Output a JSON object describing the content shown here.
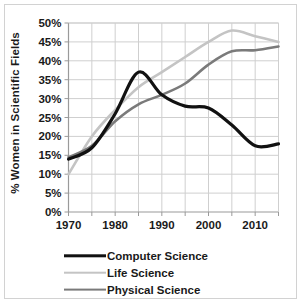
{
  "chart_data": {
    "type": "line",
    "title": "",
    "xlabel": "",
    "ylabel": "% Women in Scientific Fields",
    "xlim": [
      1970,
      2015
    ],
    "ylim": [
      0,
      50
    ],
    "grid": true,
    "legend_position": "bottom",
    "y_ticks": [
      "50%",
      "45%",
      "40%",
      "35%",
      "30%",
      "25%",
      "20%",
      "15%",
      "10%",
      "5%",
      "0%"
    ],
    "y_tick_values": [
      50,
      45,
      40,
      35,
      30,
      25,
      20,
      15,
      10,
      5,
      0
    ],
    "x_ticks": [
      "1970",
      "1980",
      "1990",
      "2000",
      "2010"
    ],
    "x_tick_values": [
      1970,
      1980,
      1990,
      2000,
      2010
    ],
    "x_minor_gridlines": [
      1975,
      1985,
      1995,
      2005,
      2015
    ],
    "x": [
      1970,
      1975,
      1980,
      1985,
      1990,
      1995,
      2000,
      2005,
      2010,
      2015
    ],
    "series": [
      {
        "name": "Computer Science",
        "color": "#111111",
        "width": 3.2,
        "values": [
          14,
          17,
          26,
          37,
          31,
          28,
          27.5,
          23,
          17.5,
          18
        ]
      },
      {
        "name": "Life Science",
        "color": "#c4c4c4",
        "width": 2.6,
        "values": [
          10,
          20,
          27,
          33,
          37,
          41,
          45,
          48,
          46.5,
          45
        ]
      },
      {
        "name": "Physical Science",
        "color": "#7a7a7a",
        "width": 2.6,
        "values": [
          14.5,
          17.5,
          24,
          28.5,
          31,
          34,
          39,
          42.5,
          42.8,
          43.8
        ]
      }
    ]
  },
  "legend": {
    "items": [
      {
        "label": "Computer Science",
        "color": "#111111",
        "width": 3.4
      },
      {
        "label": "Life Science",
        "color": "#c4c4c4",
        "width": 2.6
      },
      {
        "label": "Physical Science",
        "color": "#7a7a7a",
        "width": 2.8
      }
    ]
  },
  "axis": {
    "line_color": "#9a9a9a",
    "grid_color": "#cfcfcf"
  }
}
